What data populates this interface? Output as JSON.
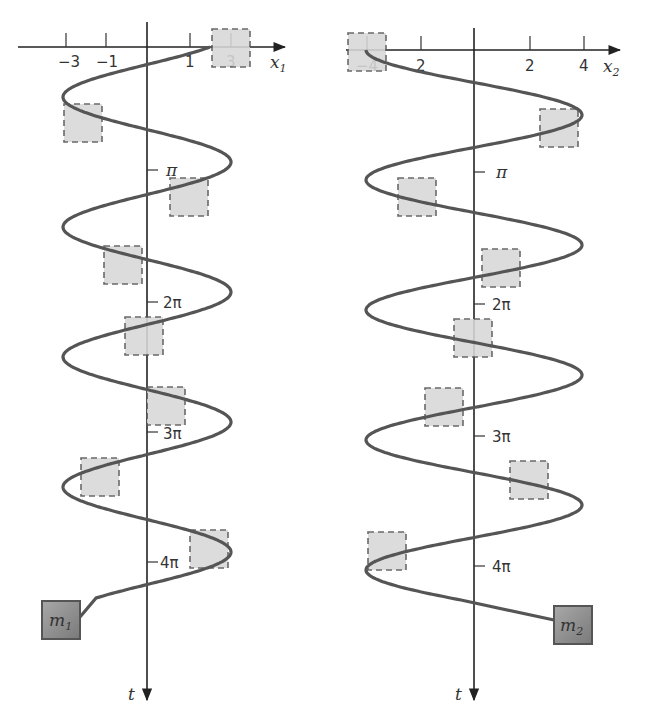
{
  "diagram": {
    "panels": [
      {
        "id": "left",
        "mass_label": "m",
        "mass_subscript": "1",
        "horizontal_axis_label": "x",
        "horizontal_axis_subscript": "1",
        "vertical_axis_label": "t",
        "x_ticks": [
          "−3",
          "−1",
          "1",
          "3"
        ],
        "t_ticks": [
          "π",
          "2π",
          "3π",
          "4π"
        ],
        "amplitude": 4,
        "initial_position": 3
      },
      {
        "id": "right",
        "mass_label": "m",
        "mass_subscript": "2",
        "horizontal_axis_label": "x",
        "horizontal_axis_subscript": "2",
        "vertical_axis_label": "t",
        "x_ticks": [
          "−4",
          "2",
          "2",
          "4"
        ],
        "t_ticks": [
          "π",
          "2π",
          "3π",
          "4π"
        ],
        "amplitude": 4,
        "initial_position": -4
      }
    ],
    "colors": {
      "curve": "#555555",
      "ghost_fill": "#d8d8d8",
      "mass_fill": "#8f8f8f",
      "axis": "#222222"
    }
  }
}
